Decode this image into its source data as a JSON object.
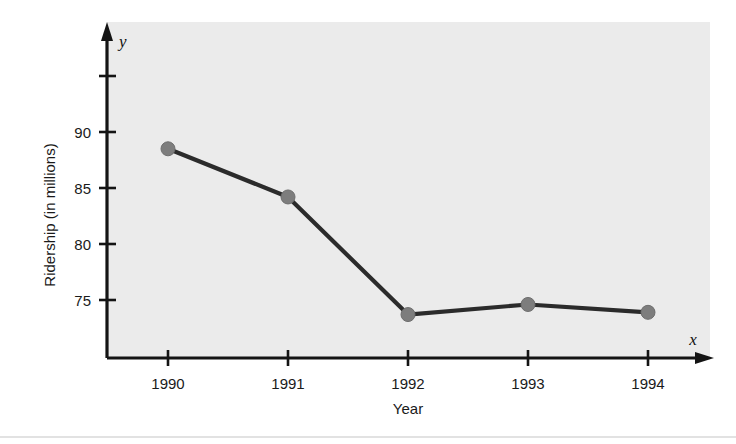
{
  "chart_data": {
    "type": "line",
    "title": "",
    "subtitle": "",
    "xlabel": "Year",
    "ylabel": "Ridership (in millions)",
    "x_axis_variable": "x",
    "y_axis_variable": "y",
    "categories": [
      "1990",
      "1991",
      "1992",
      "1993",
      "1994"
    ],
    "x": [
      1990,
      1991,
      1992,
      1993,
      1994
    ],
    "values": [
      88.5,
      84.2,
      73.7,
      74.6,
      73.9
    ],
    "series": [
      {
        "name": "Ridership",
        "values": [
          88.5,
          84.2,
          73.7,
          74.6,
          73.9
        ]
      }
    ],
    "x_tick_labels": [
      "1990",
      "1991",
      "1992",
      "1993",
      "1994"
    ],
    "y_tick_labels": [
      "75",
      "80",
      "85",
      "90"
    ],
    "y_ticks": [
      75,
      80,
      85,
      90,
      95
    ],
    "y_tick_labels_full": [
      "75",
      "80",
      "85",
      "90",
      ""
    ],
    "ylim": [
      71.5,
      96.5
    ],
    "xlim": [
      1989.5,
      1994.5
    ],
    "grid": false,
    "legend": false,
    "legend_position": "none",
    "marker": "circle",
    "annotations": [],
    "colors": {
      "plot_background": "#ebebeb",
      "page_background": "#ffffff",
      "line": "#2b2b2b",
      "marker": "#7d7d7d",
      "axis": "#141414",
      "text": "#1a1a1a"
    }
  }
}
